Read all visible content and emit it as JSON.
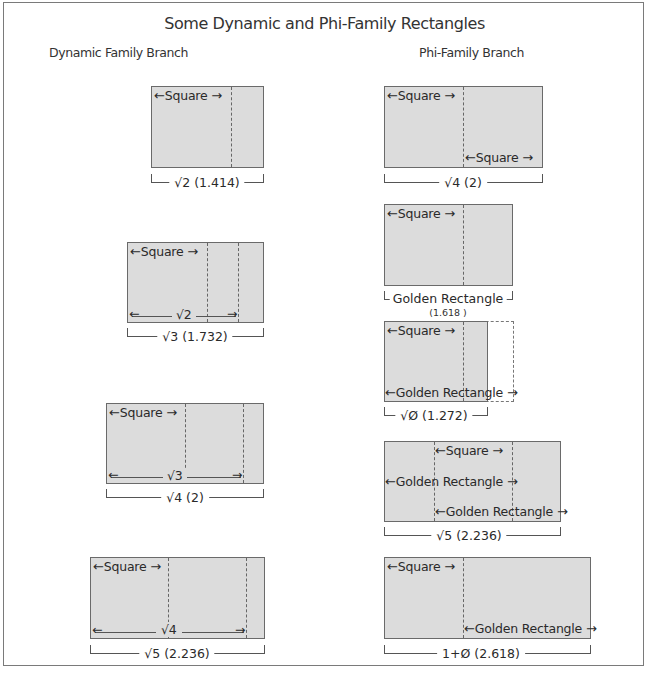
{
  "title": "Some Dynamic and Phi-Family Rectangles",
  "branches": {
    "dynamic": "Dynamic Family Branch",
    "phi": "Phi-Family Branch"
  },
  "labels": {
    "square": "Square",
    "golden_rectangle": "Golden Rectangle",
    "left_arrow": "←",
    "right_arrow": "→"
  },
  "dynamic_branch": [
    {
      "name": "root-2",
      "caption": "√2 (1.414)",
      "inner_span": ""
    },
    {
      "name": "root-3",
      "caption": "√3 (1.732)",
      "inner_span": "√2"
    },
    {
      "name": "root-4",
      "caption": "√4 (2)",
      "inner_span": "√3"
    },
    {
      "name": "root-5",
      "caption": "√5 (2.236)",
      "inner_span": "√4"
    }
  ],
  "phi_branch": [
    {
      "name": "root-4",
      "caption": "√4 (2)"
    },
    {
      "name": "golden",
      "caption": "Golden Rectangle",
      "sub_caption": "(1.618 )"
    },
    {
      "name": "root-phi",
      "caption": "√Ø (1.272)"
    },
    {
      "name": "root-5",
      "caption": "√5 (2.236)"
    },
    {
      "name": "one-plus-phi",
      "caption": "1+Ø (2.618)"
    }
  ],
  "colors": {
    "fill": "#dcdcdc",
    "stroke": "#6a6a6a",
    "frame": "#7a7a7a"
  }
}
